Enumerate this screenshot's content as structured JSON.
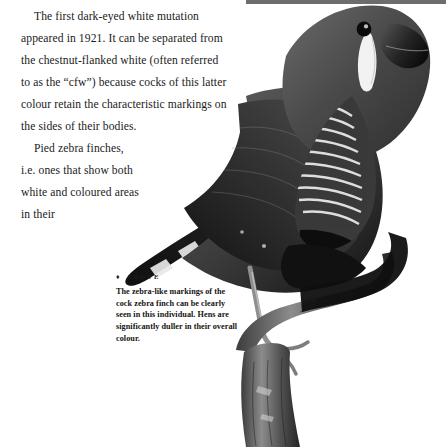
{
  "page": {
    "background_color": "#ffffff",
    "text_color": "#1a1a1a",
    "width": 446,
    "height": 447
  },
  "body_text": {
    "paragraph_1": "The first dark-eyed white mutation appeared in 1921. It can be separated from the chestnut-flanked white (often referred to as the “cfw”) because cocks of this latter colour retain the characteristic markings on the sides of their bodies.",
    "paragraph_2": "Pied zebra finches, i.e. ones that show both white and coloured areas in their"
  },
  "caption": {
    "marker": "♦",
    "heading": "ABOVE",
    "text": "The zebra-like markings of the cock zebra finch can be clearly seen in this individual. Hens are significantly duller in their overall colour."
  },
  "photograph": {
    "subject": "zebra-finch-photo",
    "description": "Black and white photograph of a cock zebra finch perched on a branch, facing right",
    "parts": [
      "bird-head",
      "bird-beak",
      "bird-eye",
      "bird-cheek-patch",
      "bird-breast-barring",
      "bird-body",
      "bird-wing",
      "bird-tail",
      "bird-leg",
      "perch-branch"
    ],
    "tone_dark": "#1c1c1c",
    "tone_mid": "#5a5a5a",
    "tone_light": "#b8b8b8"
  }
}
